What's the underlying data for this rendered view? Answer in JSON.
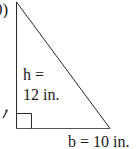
{
  "figure": {
    "part_label": "0)",
    "shape": "right-triangle",
    "height_label_line1": "h =",
    "height_label_line2": "12 in.",
    "base_label": "b = 10 in.",
    "height_value": 12,
    "base_value": 10,
    "unit": "in.",
    "stroke_color": "#2a2a2a",
    "background_color": "#ffffff"
  }
}
